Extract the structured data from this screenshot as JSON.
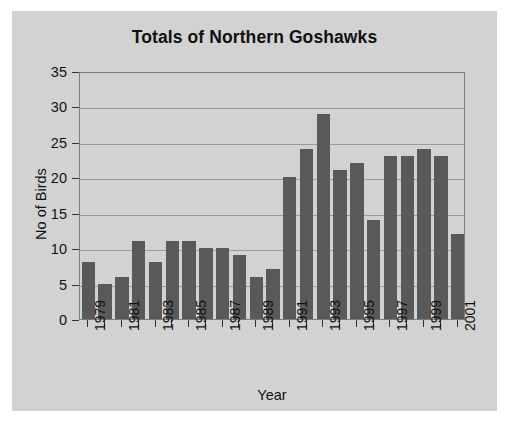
{
  "chart_data": {
    "type": "bar",
    "title": "Totals of Northern Goshawks",
    "xlabel": "Year",
    "ylabel": "No of Birds",
    "ylim": [
      0,
      35
    ],
    "ytick_step": 5,
    "yticks": [
      "0",
      "5",
      "10",
      "15",
      "20",
      "25",
      "30",
      "35"
    ],
    "grid": true,
    "legend": null,
    "bar_color": "#595959",
    "plot_background": "#d2d2d2",
    "categories": [
      "1979",
      "1980",
      "1981",
      "1982",
      "1983",
      "1984",
      "1985",
      "1986",
      "1987",
      "1988",
      "1989",
      "1990",
      "1991",
      "1992",
      "1993",
      "1994",
      "1995",
      "1996",
      "1997",
      "1998",
      "1999",
      "2000",
      "2001"
    ],
    "values": [
      8,
      5,
      6,
      11,
      8,
      11,
      11,
      10,
      10,
      9,
      6,
      7,
      20,
      24,
      29,
      21,
      22,
      14,
      23,
      23,
      24,
      23,
      12
    ],
    "xtick_labels": [
      "1979",
      "",
      "1981",
      "",
      "1983",
      "",
      "1985",
      "",
      "1987",
      "",
      "1989",
      "",
      "1991",
      "",
      "1993",
      "",
      "1995",
      "",
      "1997",
      "",
      "1999",
      "",
      "2001"
    ]
  }
}
